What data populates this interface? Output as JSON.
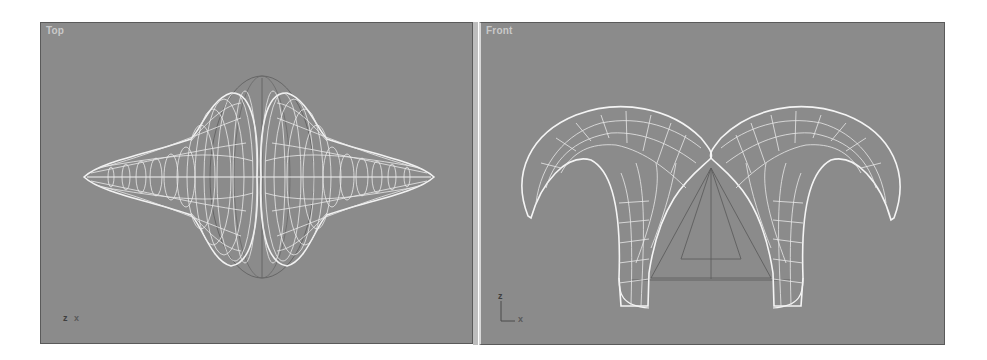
{
  "viewports": [
    {
      "label": "Top",
      "axes": {
        "vertical": "z",
        "horizontal": "x"
      },
      "object": "wireframe-mesh-horn-shape-top-view"
    },
    {
      "label": "Front",
      "axes": {
        "vertical": "z",
        "horizontal": "x"
      },
      "object": "wireframe-mesh-horn-shape-front-view"
    }
  ],
  "colors": {
    "viewport_bg": "#8b8b8b",
    "wire": "#f2f2f2",
    "gizmo": "#555555"
  }
}
